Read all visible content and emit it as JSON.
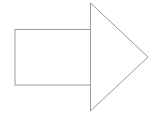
{
  "diagram": {
    "shape": "block-arrow-right",
    "stroke_color": "#9a9a9a",
    "fill_color": "#ffffff",
    "shaft": {
      "x": 15,
      "y": 29.5,
      "width": 76,
      "height": 55.5
    },
    "head": {
      "points": "90.5,3 148,57 90.5,111"
    }
  }
}
